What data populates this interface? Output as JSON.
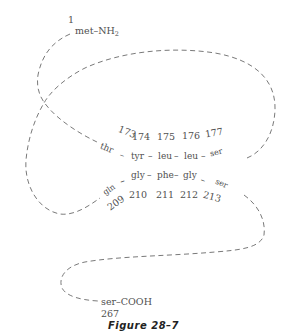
{
  "figure": {
    "caption": "Figure 28–7"
  },
  "n_terminus": {
    "number": "1",
    "label": "met–NH",
    "subscript": "2"
  },
  "c_terminus": {
    "label": "ser–COOH",
    "number": "267"
  },
  "upper_strand": {
    "residues": [
      "thr",
      "tyr",
      "leu",
      "leu",
      "ser"
    ],
    "numbers": [
      "173",
      "174",
      "175",
      "176",
      "177"
    ],
    "connector": "–"
  },
  "lower_strand": {
    "residues": [
      "gln",
      "gly",
      "phe",
      "gly",
      "ser"
    ],
    "numbers": [
      "209",
      "210",
      "211",
      "212",
      "213"
    ],
    "connector": "–"
  },
  "style": {
    "line_color": "#6a6a6a",
    "text_color": "#505050",
    "caption_color": "#222222"
  }
}
